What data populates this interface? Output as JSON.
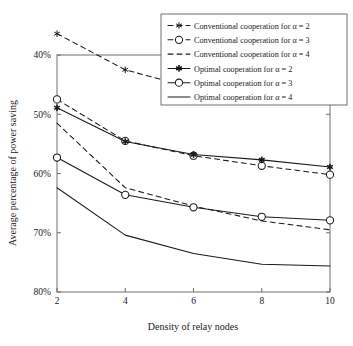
{
  "chart_data": {
    "type": "line",
    "title": "",
    "xlabel": "Density of relay nodes",
    "ylabel": "Average percentage of power saving",
    "x": [
      2,
      4,
      6,
      8,
      10
    ],
    "xtick_labels": [
      "2",
      "4",
      "6",
      "8",
      "10"
    ],
    "ytick_labels": [
      "40%",
      "50%",
      "60%",
      "70%",
      "80%"
    ],
    "ytick_values": [
      40,
      50,
      60,
      70,
      80
    ],
    "xlim": [
      2,
      10
    ],
    "ylim": [
      40,
      80
    ],
    "y_axis_inverted": true,
    "grid": false,
    "legend_position": "top-right",
    "series": [
      {
        "name": "Conventional cooperation for α = 2",
        "style": "dashed",
        "marker": "star",
        "marker_fill": "none",
        "values": [
          36.4,
          42.5,
          45.6,
          46.4,
          47.2
        ]
      },
      {
        "name": "Conventional cooperation for α = 3",
        "style": "dashed",
        "marker": "circle",
        "marker_fill": "none",
        "values": [
          47.5,
          54.5,
          57.0,
          58.7,
          60.2
        ]
      },
      {
        "name": "Conventional cooperation for α = 4",
        "style": "dashed",
        "marker": "none",
        "marker_fill": "none",
        "values": [
          51.5,
          62.4,
          65.5,
          68.0,
          69.5
        ]
      },
      {
        "name": "Optimal cooperation for α = 2",
        "style": "solid",
        "marker": "star",
        "marker_fill": "filled",
        "values": [
          48.9,
          54.6,
          56.8,
          57.7,
          58.9
        ]
      },
      {
        "name": "Optimal cooperation for α = 3",
        "style": "solid",
        "marker": "circle",
        "marker_fill": "none",
        "values": [
          57.3,
          63.6,
          65.7,
          67.3,
          67.9
        ]
      },
      {
        "name": "Optimal cooperation for α = 4",
        "style": "solid",
        "marker": "none",
        "marker_fill": "none",
        "values": [
          62.4,
          70.4,
          73.5,
          75.3,
          75.6
        ]
      }
    ],
    "colors": {
      "line": "#1a1a1a",
      "frame": "#6f6f6f",
      "background": "#ffffff"
    }
  }
}
